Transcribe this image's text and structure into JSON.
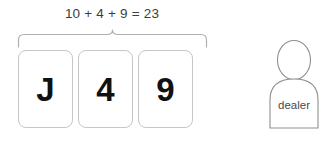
{
  "scene": {
    "background_color": "#ffffff",
    "width": 332,
    "height": 142
  },
  "hand": {
    "sum_label": "10 + 4 + 9 = 23",
    "total": 23,
    "cards": [
      {
        "value": "J",
        "points": 10
      },
      {
        "value": "4",
        "points": 4
      },
      {
        "value": "9",
        "points": 9
      }
    ],
    "brace_color": "#b0b0b0",
    "card_border_color": "#c6c6c6",
    "card_text_color": "#111111",
    "sum_text_color": "#3d3d3d"
  },
  "dealer": {
    "label": "dealer",
    "outline_color": "#8f8f8f",
    "label_color": "#4a4a4a"
  }
}
